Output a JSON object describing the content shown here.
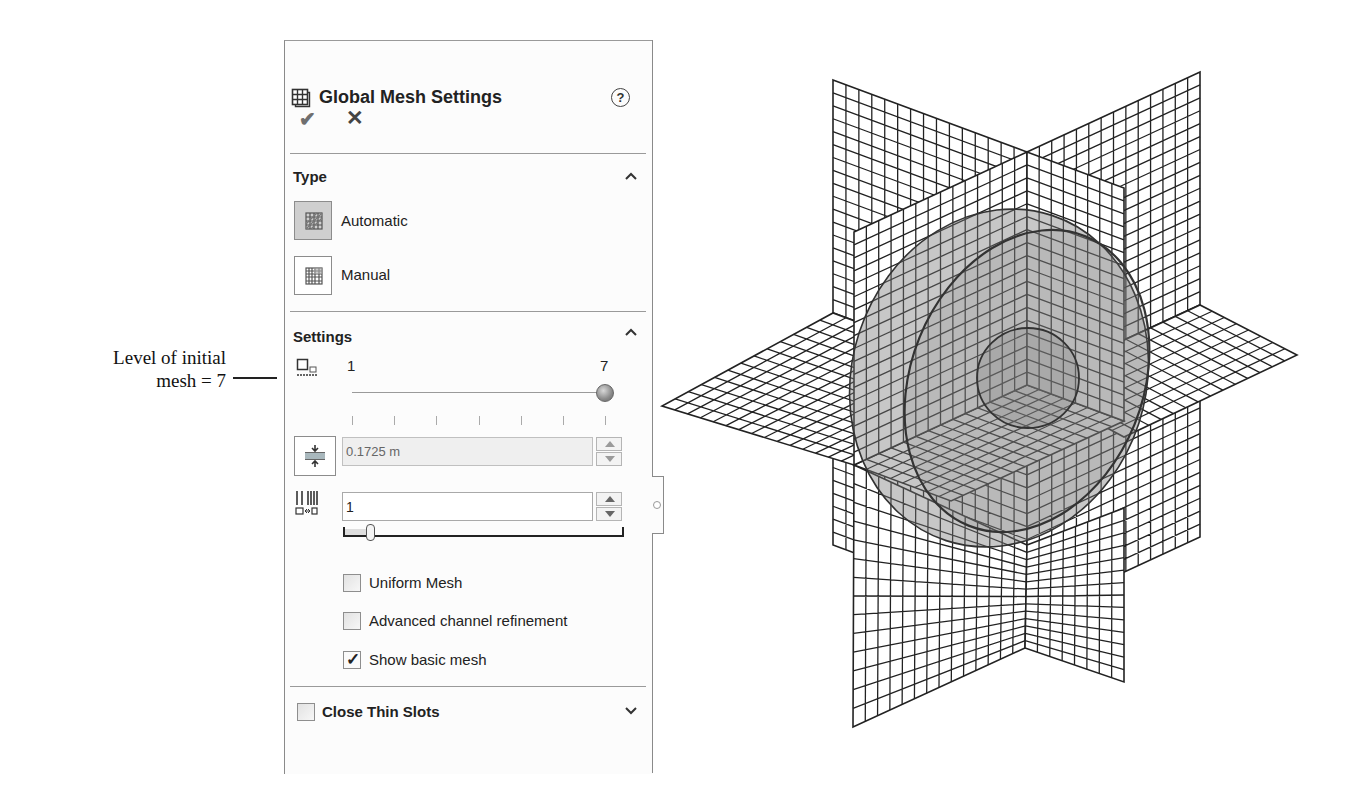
{
  "annotation": {
    "line1": "Level of initial",
    "line2": "mesh = 7"
  },
  "panel": {
    "title": "Global Mesh Settings",
    "title_icon": "mesh-settings-icon",
    "help_label": "?",
    "ok_label": "✔",
    "cancel_label": "✕",
    "type_section": {
      "title": "Type",
      "collapse_icon": "chevron-up-icon",
      "options": [
        {
          "label": "Automatic",
          "selected": true,
          "icon": "automatic-mesh-icon"
        },
        {
          "label": "Manual",
          "selected": false,
          "icon": "manual-mesh-icon"
        }
      ]
    },
    "settings_section": {
      "title": "Settings",
      "collapse_icon": "chevron-up-icon",
      "level_slider": {
        "icon": "level-of-initial-mesh-icon",
        "min_label": "1",
        "max_label": "7",
        "value": 7,
        "ticks": 7
      },
      "min_gap_field": {
        "icon": "minimum-gap-size-icon",
        "value": "0.1725 m",
        "enabled": false
      },
      "ratio_field": {
        "icon": "ratio-factor-icon",
        "value": "1",
        "slider_value": 1
      },
      "checkboxes": [
        {
          "label": "Uniform Mesh",
          "checked": false
        },
        {
          "label": "Advanced channel refinement",
          "checked": false
        },
        {
          "label": "Show basic mesh",
          "checked": true
        }
      ]
    },
    "close_thin_slots": {
      "label": "Close Thin Slots",
      "checked": false,
      "expand_icon": "chevron-down-icon"
    }
  },
  "viewport": {
    "description": "Basic mesh preview: three orthogonal meshed planes intersecting a translucent sphere",
    "planes": 3,
    "object": "sphere",
    "colors": {
      "mesh_line": "#222222",
      "sphere_fill": "#7a7a7a",
      "sphere_outline": "#333333",
      "selected_button_bg": "#cfcfcf"
    }
  }
}
